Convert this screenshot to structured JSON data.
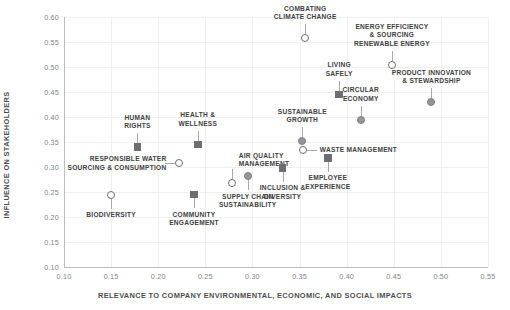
{
  "chart_data": {
    "type": "scatter",
    "title": "",
    "xlabel": "RELEVANCE TO COMPANY ENVIRONMENTAL, ECONOMIC, AND SOCIAL IMPACTS",
    "ylabel": "INFLUENCE ON STAKEHOLDERS",
    "xlim": [
      0.1,
      0.55
    ],
    "ylim": [
      0.1,
      0.6
    ],
    "xticks": [
      "0.10",
      "0.15",
      "0.20",
      "0.25",
      "0.30",
      "0.35",
      "0.40",
      "0.45",
      "0.50",
      "0.55"
    ],
    "yticks": [
      "0.10",
      "0.15",
      "0.20",
      "0.25",
      "0.30",
      "0.35",
      "0.40",
      "0.45",
      "0.50",
      "0.55",
      "0.60"
    ],
    "grid": true,
    "legend": "none",
    "marker_styles": {
      "circle-open": "#ffffff fill, #6d6e71 outline",
      "circle-filled": "#939598",
      "square-filled": "#6d6e71"
    },
    "points": [
      {
        "label": "BIODIVERSITY",
        "x": 0.15,
        "y": 0.245,
        "marker": "circle-open",
        "label_pos": "below"
      },
      {
        "label": "HUMAN\nRIGHTS",
        "x": 0.178,
        "y": 0.34,
        "marker": "square-filled",
        "label_pos": "above"
      },
      {
        "label": "RESPONSIBLE WATER\nSOURCING & CONSUMPTION",
        "x": 0.222,
        "y": 0.308,
        "marker": "circle-open",
        "label_pos": "left"
      },
      {
        "label": "COMMUNITY\nENGAGEMENT",
        "x": 0.238,
        "y": 0.245,
        "marker": "square-filled",
        "label_pos": "below"
      },
      {
        "label": "HEALTH &\nWELLNESS",
        "x": 0.242,
        "y": 0.345,
        "marker": "square-filled",
        "label_pos": "above"
      },
      {
        "label": "AIR QUALITY\nMANAGEMENT",
        "x": 0.278,
        "y": 0.268,
        "marker": "circle-open",
        "label_pos": "above-right"
      },
      {
        "label": "SUPPLY CHAIN\nSUSTAINABILITY",
        "x": 0.295,
        "y": 0.282,
        "marker": "circle-filled",
        "label_pos": "below"
      },
      {
        "label": "INCLUSION &\nDIVERSITY",
        "x": 0.332,
        "y": 0.298,
        "marker": "square-filled",
        "label_pos": "below"
      },
      {
        "label": "SUSTAINABLE\nGROWTH",
        "x": 0.353,
        "y": 0.352,
        "marker": "circle-filled",
        "label_pos": "above"
      },
      {
        "label": "WASTE MANAGEMENT",
        "x": 0.354,
        "y": 0.335,
        "marker": "circle-open",
        "label_pos": "right"
      },
      {
        "label": "EMPLOYEE\nEXPERIENCE",
        "x": 0.38,
        "y": 0.318,
        "marker": "square-filled",
        "label_pos": "below"
      },
      {
        "label": "COMBATING\nCLIMATE CHANGE",
        "x": 0.356,
        "y": 0.558,
        "marker": "circle-open",
        "label_pos": "above"
      },
      {
        "label": "LIVING\nSAFELY",
        "x": 0.392,
        "y": 0.445,
        "marker": "square-filled",
        "label_pos": "above"
      },
      {
        "label": "CIRCULAR\nECONOMY",
        "x": 0.415,
        "y": 0.395,
        "marker": "circle-filled",
        "label_pos": "above"
      },
      {
        "label": "ENERGY EFFICIENCY\n& SOURCING\nRENEWABLE ENERGY",
        "x": 0.448,
        "y": 0.505,
        "marker": "circle-open",
        "label_pos": "above"
      },
      {
        "label": "PRODUCT INNOVATION\n& STEWARDSHIP",
        "x": 0.49,
        "y": 0.43,
        "marker": "circle-filled",
        "label_pos": "above"
      }
    ]
  }
}
